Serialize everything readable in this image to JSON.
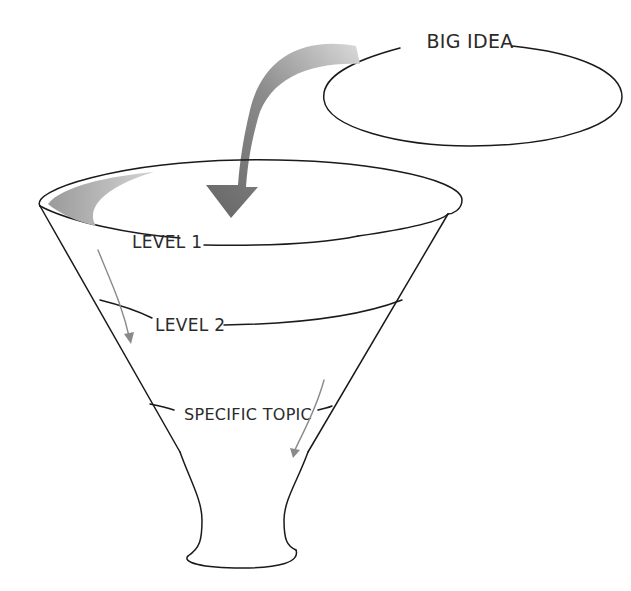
{
  "diagram": {
    "type": "funnel",
    "big_idea": {
      "label": "BIG IDEA"
    },
    "levels": [
      {
        "id": "level-1",
        "label": "LEVEL 1"
      },
      {
        "id": "level-2",
        "label": "LEVEL 2"
      },
      {
        "id": "specific-topic",
        "label": "SPECIFIC TOPIC"
      }
    ],
    "colors": {
      "stroke": "#1a1a1a",
      "arrow_dark": "#6e6e6e",
      "arrow_light": "#d0d0d0",
      "thin_arrow": "#8a8a8a",
      "background": "#ffffff"
    }
  }
}
